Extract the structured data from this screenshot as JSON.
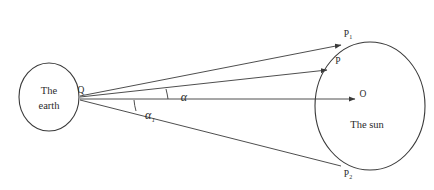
{
  "figure": {
    "background_color": "#ffffff",
    "line_color": "#3a3a3a",
    "text_color": "#2b2b2b"
  },
  "bodies": {
    "earth": {
      "label_line1": "The",
      "label_line2": "earth",
      "shape": "ellipse",
      "cx": 49,
      "cy": 97,
      "rx": 30,
      "ry": 34
    },
    "sun": {
      "label": "The sun",
      "shape": "ellipse",
      "cx": 370,
      "cy": 106,
      "rx": 55,
      "ry": 64
    }
  },
  "points": {
    "vertex": {
      "label": "Q",
      "x": 80,
      "y": 95
    },
    "top_tangent": {
      "label": "P",
      "subscript": "1",
      "x": 348,
      "y": 37
    },
    "intermediate": {
      "label": "P",
      "subscript": "",
      "x": 340,
      "y": 63
    },
    "center": {
      "label": "O",
      "subscript": "",
      "x": 363,
      "y": 97
    },
    "bottom_tangent": {
      "label": "P",
      "subscript": "2",
      "x": 348,
      "y": 175
    }
  },
  "angles": {
    "upper": {
      "label": "α",
      "subscript": "",
      "x": 184,
      "y": 101
    },
    "lower": {
      "label": "α",
      "subscript": "1",
      "x": 152,
      "y": 118
    }
  },
  "rays": {
    "to_top_tangent": {
      "from": "Q",
      "to": "P1"
    },
    "to_intermediate": {
      "from": "Q",
      "to": "P"
    },
    "to_center": {
      "from": "Q",
      "to": "O"
    },
    "to_bottom_tangent": {
      "from": "Q",
      "to": "P2"
    }
  }
}
